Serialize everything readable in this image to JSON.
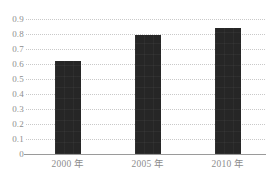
{
  "chart_data": {
    "type": "bar",
    "title": "",
    "subtitle": "",
    "xlabel": "",
    "ylabel": "",
    "categories": [
      "2000 年",
      "2005 年",
      "2010 年"
    ],
    "values": [
      0.62,
      0.795,
      0.84
    ],
    "ylim": [
      0,
      0.9
    ],
    "ytick_labels": [
      "0.9",
      "0.8",
      "0.7",
      "0.6",
      "0.5",
      "0.4",
      "0.3",
      "0.2",
      "0.1",
      "0"
    ],
    "ytick_values": [
      0.9,
      0.8,
      0.7,
      0.6,
      0.5,
      0.4,
      0.3,
      0.2,
      0.1,
      0
    ],
    "grid": true,
    "grid_style": "dotted",
    "legend": null,
    "legend_position": "none",
    "series": [
      {
        "name": "",
        "values": [
          0.62,
          0.795,
          0.84
        ]
      }
    ],
    "colors": {
      "bar": "#262626",
      "grid": "#c9c9c9",
      "axis": "#9a9a9a",
      "tick_text": "#8d8d8d",
      "background": "#ffffff"
    }
  }
}
